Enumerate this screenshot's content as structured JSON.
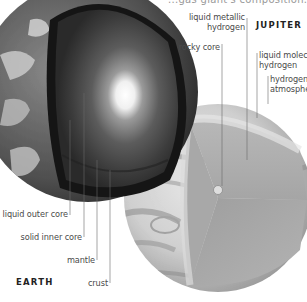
{
  "top_caption": "...gas giant's composition...",
  "earth": {
    "title": "EARTH",
    "labels": {
      "liquid_outer_core": "liquid outer core",
      "solid_inner_core": "solid inner core",
      "mantle": "mantle",
      "crust": "crust"
    }
  },
  "jupiter": {
    "title": "JUPITER",
    "labels": {
      "liquid_metallic_hydrogen_1": "liquid metallic",
      "liquid_metallic_hydrogen_2": "hydrogen",
      "rocky_core": "rocky core",
      "liquid_molecular_hydrogen_1": "liquid molecular",
      "liquid_molecular_hydrogen_2": "hydrogen",
      "hydrogen_atmosphere_1": "hydrogen",
      "hydrogen_atmosphere_2": "atmosphere"
    }
  },
  "colors": {
    "label_text": "#4a4a4a",
    "leader_line": "#6a6a6a",
    "background": "#ffffff"
  }
}
